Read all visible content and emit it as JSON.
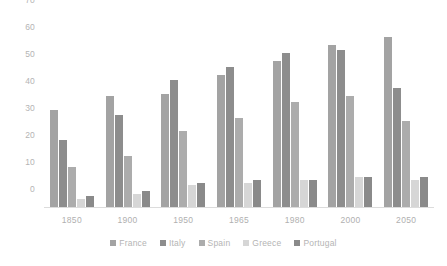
{
  "chart_data": {
    "type": "bar",
    "title": "",
    "subtitle": "",
    "xlabel": "",
    "ylabel": "",
    "categories": [
      "1850",
      "1900",
      "1950",
      "1965",
      "1980",
      "2000",
      "2050"
    ],
    "series": [
      {
        "name": "France",
        "color": "#a3a3a3",
        "values": [
          36,
          41,
          42,
          49,
          54,
          60,
          63
        ]
      },
      {
        "name": "Italy",
        "color": "#8d8d8d",
        "values": [
          25,
          34,
          47,
          52,
          57,
          58,
          44
        ]
      },
      {
        "name": "Spain",
        "color": "#acacac",
        "values": [
          15,
          19,
          28,
          33,
          39,
          41,
          32
        ]
      },
      {
        "name": "Greece",
        "color": "#d6d6d6",
        "values": [
          3,
          5,
          8,
          9,
          10,
          11,
          10
        ]
      },
      {
        "name": "Portugal",
        "color": "#8a8a8a",
        "values": [
          4,
          6,
          9,
          10,
          10,
          11,
          11
        ]
      }
    ],
    "ylim": [
      0,
      70
    ],
    "yticks": [
      0,
      10,
      20,
      30,
      40,
      50,
      60,
      70
    ],
    "ytick_labels": [
      "0",
      "10",
      "20",
      "30",
      "40",
      "50",
      "60",
      "70"
    ],
    "grid": false,
    "legend_position": "bottom",
    "axis_line_color": "#dcdcdc",
    "tick_label_color": "#b4b4b4",
    "background_color": "#ffffff"
  },
  "legend": {
    "items": [
      {
        "label": "France"
      },
      {
        "label": "Italy"
      },
      {
        "label": "Spain"
      },
      {
        "label": "Greece"
      },
      {
        "label": "Portugal"
      }
    ]
  }
}
